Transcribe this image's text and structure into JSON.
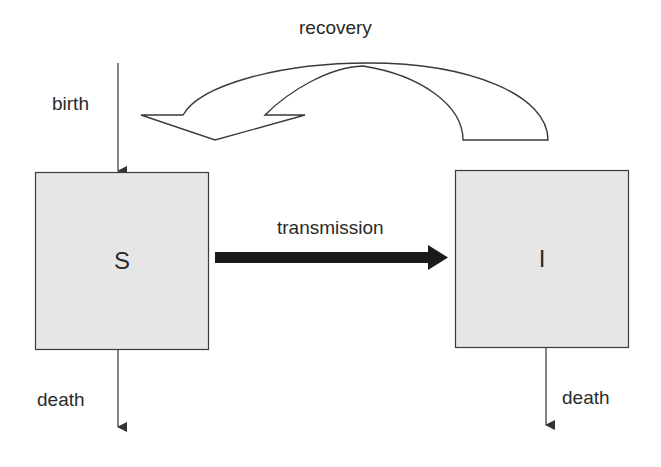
{
  "diagram": {
    "type": "compartmental-model",
    "compartments": [
      {
        "id": "S",
        "label": "S",
        "fill": "#e6e6e6"
      },
      {
        "id": "I",
        "label": "I",
        "fill": "#e6e6e6"
      }
    ],
    "flows": {
      "birth": {
        "label": "birth",
        "to": "S"
      },
      "transmission": {
        "label": "transmission",
        "from": "S",
        "to": "I"
      },
      "recovery": {
        "label": "recovery",
        "from": "I",
        "to": "S"
      },
      "death_s": {
        "label": "death",
        "from": "S"
      },
      "death_i": {
        "label": "death",
        "from": "I"
      }
    },
    "colors": {
      "box_fill": "#e6e6e6",
      "stroke": "#3a3a3a",
      "transmission_arrow": "#1a1a1a",
      "background": "#ffffff"
    }
  }
}
